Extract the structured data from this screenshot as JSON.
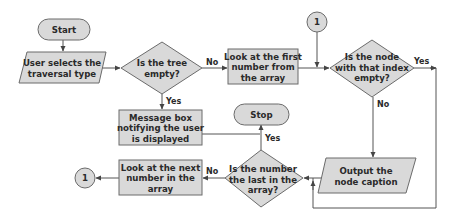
{
  "diagram": {
    "type": "flowchart",
    "colors": {
      "shape_fill": "#d9d9d9",
      "shape_stroke": "#6b6b6b",
      "line": "#555555",
      "text": "#2a2a2a"
    },
    "nodes": {
      "start": {
        "shape": "terminator",
        "label": "Start"
      },
      "select_type": {
        "shape": "parallelogram",
        "lines": [
          "User selects the",
          "traversal type"
        ]
      },
      "tree_empty": {
        "shape": "decision",
        "lines": [
          "Is the tree",
          "empty?"
        ]
      },
      "first_number": {
        "shape": "process",
        "lines": [
          "Look at the first",
          "number from",
          "the array"
        ]
      },
      "connector_top": {
        "shape": "connector",
        "label": "1"
      },
      "node_empty": {
        "shape": "decision",
        "lines": [
          "Is the node",
          "with that index",
          "empty?"
        ]
      },
      "message_box": {
        "shape": "process",
        "lines": [
          "Message box",
          "notifying the user",
          "is displayed"
        ]
      },
      "stop": {
        "shape": "terminator",
        "label": "Stop"
      },
      "last_number": {
        "shape": "decision",
        "lines": [
          "Is the number",
          "the last in the",
          "array?"
        ]
      },
      "next_number": {
        "shape": "process",
        "lines": [
          "Look at the next",
          "number in the",
          "array"
        ]
      },
      "connector_bottom": {
        "shape": "connector",
        "label": "1"
      },
      "output_caption": {
        "shape": "parallelogram",
        "lines": [
          "Output the",
          "node caption"
        ]
      }
    },
    "edges": [
      {
        "from": "start",
        "to": "select_type",
        "label": ""
      },
      {
        "from": "select_type",
        "to": "tree_empty",
        "label": ""
      },
      {
        "from": "tree_empty",
        "to": "first_number",
        "label": "No"
      },
      {
        "from": "tree_empty",
        "to": "message_box",
        "label": "Yes"
      },
      {
        "from": "first_number",
        "to": "node_empty",
        "label": ""
      },
      {
        "from": "connector_top",
        "to": "node_empty",
        "label": ""
      },
      {
        "from": "node_empty",
        "to": "last_number",
        "label": "Yes"
      },
      {
        "from": "node_empty",
        "to": "output_caption",
        "label": "No"
      },
      {
        "from": "output_caption",
        "to": "last_number",
        "label": ""
      },
      {
        "from": "message_box",
        "to": "stop",
        "label": ""
      },
      {
        "from": "last_number",
        "to": "stop",
        "label": "Yes"
      },
      {
        "from": "last_number",
        "to": "next_number",
        "label": "No"
      },
      {
        "from": "next_number",
        "to": "connector_bottom",
        "label": ""
      }
    ],
    "edge_labels": {
      "tree_no": "No",
      "tree_yes": "Yes",
      "node_yes": "Yes",
      "node_no": "No",
      "last_yes": "Yes",
      "last_no": "No"
    }
  }
}
